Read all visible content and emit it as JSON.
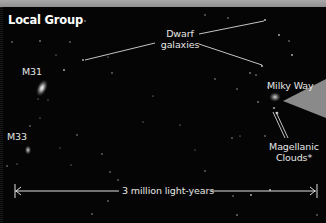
{
  "title": "Local Group",
  "labels": {
    "dwarf_line1": "Dwarf",
    "dwarf_line2": "galaxies",
    "m31": "M31",
    "m33": "M33",
    "milky_way": "Milky Way",
    "magellanic_line1": "Magellanic",
    "magellanic_line2": "Clouds*"
  },
  "scale_bar": {
    "label": "3 million light-years"
  },
  "colors": {
    "background": "#050505",
    "top_band": "#9a9a9a",
    "wedge": "#8a8a8a",
    "text": "#e6e6e6",
    "lines": "#d8d8d8"
  }
}
